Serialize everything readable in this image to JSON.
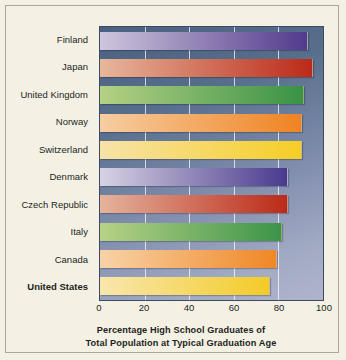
{
  "chart_data": {
    "type": "bar",
    "orientation": "horizontal",
    "title": "",
    "xlabel": "Percentage High School Graduates of Total Population at Typical Graduation Age",
    "xlabel_lines": [
      "Percentage High School Graduates of",
      "Total Population at Typical Graduation Age"
    ],
    "ylabel": "",
    "xlim": [
      0,
      100
    ],
    "xticks": [
      0,
      20,
      40,
      60,
      80,
      100
    ],
    "xticklabels": [
      "0",
      "20",
      "40",
      "60",
      "80",
      "100"
    ],
    "grid": true,
    "grid_axis": "x",
    "legend": false,
    "categories": [
      "Finland",
      "Japan",
      "United Kingdom",
      "Norway",
      "Switzerland",
      "Denmark",
      "Czech Republic",
      "Italy",
      "Canada",
      "United States"
    ],
    "values": [
      93,
      95,
      91,
      90,
      90,
      84,
      84,
      81,
      79,
      76
    ],
    "highlight": "United States",
    "bars": [
      {
        "label": "Finland",
        "value": 93,
        "color_start": "#cfc6dd",
        "color_end": "#513a8c",
        "emphasis": false
      },
      {
        "label": "Japan",
        "value": 95,
        "color_start": "#e8b79c",
        "color_end": "#bb2a18",
        "emphasis": false
      },
      {
        "label": "United Kingdom",
        "value": 91,
        "color_start": "#b5d184",
        "color_end": "#399246",
        "emphasis": false
      },
      {
        "label": "Norway",
        "value": 90,
        "color_start": "#f6cda2",
        "color_end": "#ef8322",
        "emphasis": false
      },
      {
        "label": "Switzerland",
        "value": 90,
        "color_start": "#f7e3a8",
        "color_end": "#f5ce26",
        "emphasis": false
      },
      {
        "label": "Denmark",
        "value": 84,
        "color_start": "#d8d2e3",
        "color_end": "#4a3a8e",
        "emphasis": false
      },
      {
        "label": "Czech Republic",
        "value": 84,
        "color_start": "#e5b39c",
        "color_end": "#bb2a18",
        "emphasis": false
      },
      {
        "label": "Italy",
        "value": 81,
        "color_start": "#b7d286",
        "color_end": "#3c9449",
        "emphasis": false
      },
      {
        "label": "Canada",
        "value": 79,
        "color_start": "#f8d3a8",
        "color_end": "#ef8726",
        "emphasis": false
      },
      {
        "label": "United States",
        "value": 76,
        "color_start": "#f8e7ad",
        "color_end": "#f3cb28",
        "emphasis": true
      }
    ]
  },
  "colors": {
    "page_background": "#f4f1e4",
    "frame_border": "#a9a69a",
    "plot_background_top": "#4a6180",
    "plot_background_bottom": "#aeb4cb",
    "gridline": "#ffffff",
    "text": "#231f1c"
  }
}
